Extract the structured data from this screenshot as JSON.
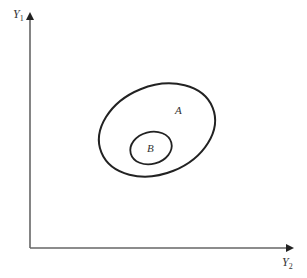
{
  "diagram": {
    "type": "set-ellipse-plot",
    "axes": {
      "y_label": "Y",
      "y_subscript": "1",
      "x_label": "Y",
      "x_subscript": "2",
      "color": "#555555"
    },
    "regions": [
      {
        "id": "A",
        "label": "A",
        "role": "outer-ellipse"
      },
      {
        "id": "B",
        "label": "B",
        "role": "inner-ellipse"
      }
    ],
    "stroke_color": "#222222"
  }
}
